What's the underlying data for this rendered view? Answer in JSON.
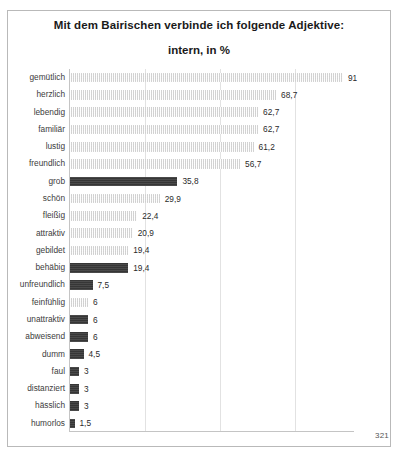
{
  "page": {
    "page_number": "321",
    "bleed_text": "· · ·"
  },
  "chart_data": {
    "type": "bar",
    "orientation": "horizontal",
    "title": "Mit dem Bairischen verbinde ich folgende Adjektive:",
    "subtitle": "intern, in %",
    "xlabel": "",
    "ylabel": "",
    "xlim": [
      0,
      95
    ],
    "grid": true,
    "gridlines": [
      25,
      50,
      75
    ],
    "legend": "none",
    "colors": {
      "positive_bar": "#e9e9e9",
      "negative_bar": "#3c3c3c",
      "frame": "#b9b9b9",
      "axis": "#c4c4c4",
      "gridline": "#e2e2e2",
      "text": "#3c3c3c"
    },
    "categories": [
      "gemütlich",
      "herzlich",
      "lebendig",
      "familiär",
      "lustig",
      "freundlich",
      "grob",
      "schön",
      "fleißig",
      "attraktiv",
      "gebildet",
      "behäbig",
      "unfreundlich",
      "feinfühlig",
      "unattraktiv",
      "abweisend",
      "dumm",
      "faul",
      "distanziert",
      "hässlich",
      "humorlos"
    ],
    "values": [
      91,
      68.7,
      62.7,
      62.7,
      61.2,
      56.7,
      35.8,
      29.9,
      22.4,
      20.9,
      19.4,
      19.4,
      7.5,
      6,
      6,
      6,
      4.5,
      3,
      3,
      3,
      1.5
    ],
    "value_labels": [
      "91",
      "68,7",
      "62,7",
      "62,7",
      "61,2",
      "56,7",
      "35,8",
      "29,9",
      "22,4",
      "20,9",
      "19,4",
      "19,4",
      "7,5",
      "6",
      "6",
      "6",
      "4,5",
      "3",
      "3",
      "3",
      "1,5"
    ],
    "bar_styles": [
      "light",
      "light",
      "light",
      "light",
      "light",
      "light",
      "dark",
      "light",
      "light",
      "light",
      "light",
      "dark",
      "dark",
      "light",
      "dark",
      "dark",
      "dark",
      "dark",
      "dark",
      "dark",
      "dark"
    ]
  }
}
